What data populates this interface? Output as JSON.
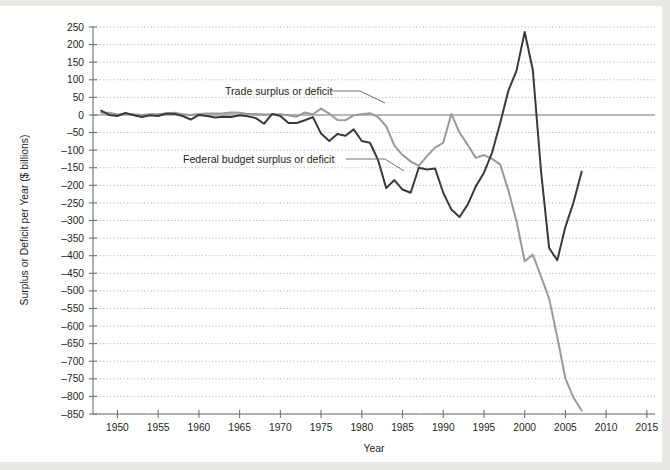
{
  "chart_data": {
    "type": "line",
    "title": "",
    "xlabel": "Year",
    "ylabel": "Surplus or Deficit per Year ($ billions)",
    "xlim": [
      1947,
      2016
    ],
    "ylim": [
      -850,
      250
    ],
    "grid": true,
    "legend": "inline-annotations",
    "xticks": [
      1950,
      1955,
      1960,
      1965,
      1970,
      1975,
      1980,
      1985,
      1990,
      1995,
      2000,
      2005,
      2010,
      2015
    ],
    "yticks": [
      250,
      200,
      150,
      100,
      50,
      0,
      -50,
      -100,
      -150,
      -200,
      -250,
      -300,
      -350,
      -400,
      -450,
      -500,
      -550,
      -600,
      -650,
      -700,
      -750,
      -800,
      -850
    ],
    "annotations": [
      {
        "text": "Trade surplus or deficit",
        "x": 1968,
        "y": 70
      },
      {
        "text": "Federal budget surplus or deficit",
        "x": 1965,
        "y": -140
      }
    ],
    "series": [
      {
        "name": "Federal budget surplus or deficit",
        "color": "#3a3a3c",
        "x": [
          1948,
          1949,
          1950,
          1951,
          1952,
          1953,
          1954,
          1955,
          1956,
          1957,
          1958,
          1959,
          1960,
          1961,
          1962,
          1963,
          1964,
          1965,
          1966,
          1967,
          1968,
          1969,
          1970,
          1971,
          1972,
          1973,
          1974,
          1975,
          1976,
          1977,
          1978,
          1979,
          1980,
          1981,
          1982,
          1983,
          1984,
          1985,
          1986,
          1987,
          1988,
          1989,
          1990,
          1991,
          1992,
          1993,
          1994,
          1995,
          1996,
          1997,
          1998,
          1999,
          2000,
          2001,
          2002,
          2003,
          2004,
          2005,
          2006,
          2007
        ],
        "y": [
          12,
          0,
          -3,
          6,
          -1,
          -6,
          -1,
          -3,
          4,
          3,
          -3,
          -13,
          0,
          -3,
          -7,
          -5,
          -6,
          -1,
          -4,
          -9,
          -25,
          3,
          -3,
          -23,
          -23,
          -15,
          -6,
          -53,
          -74,
          -54,
          -59,
          -41,
          -74,
          -79,
          -128,
          -208,
          -185,
          -212,
          -221,
          -150,
          -155,
          -152,
          -221,
          -269,
          -290,
          -255,
          -203,
          -164,
          -107,
          -22,
          69,
          126,
          236,
          128,
          -158,
          -378,
          -413,
          -318,
          -248,
          -161
        ]
      },
      {
        "name": "Trade surplus or deficit",
        "color": "#9a9a9c",
        "x": [
          1948,
          1949,
          1950,
          1951,
          1952,
          1953,
          1954,
          1955,
          1956,
          1957,
          1958,
          1959,
          1960,
          1961,
          1962,
          1963,
          1964,
          1965,
          1966,
          1967,
          1968,
          1969,
          1970,
          1971,
          1972,
          1973,
          1974,
          1975,
          1976,
          1977,
          1978,
          1979,
          1980,
          1981,
          1982,
          1983,
          1984,
          1985,
          1986,
          1987,
          1988,
          1989,
          1990,
          1991,
          1992,
          1993,
          1994,
          1995,
          1996,
          1997,
          1998,
          1999,
          2000,
          2001,
          2002,
          2003,
          2004,
          2005,
          2006,
          2007
        ],
        "y": [
          6,
          6,
          1,
          3,
          2,
          0,
          2,
          2,
          4,
          6,
          2,
          0,
          3,
          4,
          4,
          5,
          7,
          6,
          3,
          3,
          1,
          1,
          2,
          -1,
          -5,
          7,
          2,
          18,
          4,
          -14,
          -15,
          -1,
          2,
          5,
          -6,
          -32,
          -87,
          -114,
          -132,
          -145,
          -117,
          -93,
          -79,
          3,
          -50,
          -85,
          -122,
          -114,
          -125,
          -141,
          -215,
          -302,
          -416,
          -397,
          -459,
          -522,
          -631,
          -749,
          -804,
          -840
        ]
      }
    ]
  },
  "axis": {
    "y_title": "Surplus or Deficit per Year ($ billions)",
    "x_title": "Year",
    "ytick_labels": [
      "250",
      "200",
      "150",
      "100",
      "50",
      "0",
      "–50",
      "–100",
      "–150",
      "–200",
      "–250",
      "–300",
      "–350",
      "–400",
      "–450",
      "–500",
      "–550",
      "–600",
      "–650",
      "–700",
      "–750",
      "–800",
      "–850"
    ],
    "xtick_labels": [
      "1950",
      "1955",
      "1960",
      "1965",
      "1970",
      "1975",
      "1980",
      "1985",
      "1990",
      "1995",
      "2000",
      "2005",
      "2010",
      "2015"
    ]
  },
  "labels": {
    "trade": "Trade surplus or deficit",
    "budget": "Federal budget surplus or deficit"
  }
}
